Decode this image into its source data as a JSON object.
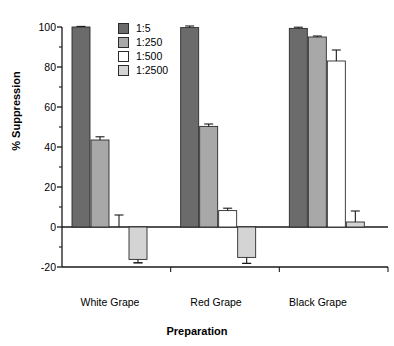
{
  "chart_data": {
    "type": "bar",
    "title": "",
    "subtitle": "",
    "xlabel": "Preparation",
    "ylabel": "% Suppression",
    "categories": [
      "White Grape",
      "Red Grape",
      "Black Grape"
    ],
    "ylim": [
      -20,
      100
    ],
    "yticks": [
      -20,
      0,
      20,
      40,
      60,
      80,
      100
    ],
    "ytick_labels": [
      "-20",
      "0",
      "20",
      "40",
      "60",
      "80",
      "100"
    ],
    "minor_ticks": true,
    "grid": false,
    "legend_position": "upper-left-inside",
    "zero_line": true,
    "series": [
      {
        "name": "1:5",
        "color": "#6b6b6b",
        "values": [
          100,
          99.7,
          99.3
        ],
        "errors": [
          0.3,
          0.8,
          0.6
        ]
      },
      {
        "name": "1:250",
        "color": "#a8a8a8",
        "values": [
          43.5,
          50.3,
          95.0
        ],
        "errors": [
          1.6,
          1.2,
          0.5
        ]
      },
      {
        "name": "1:500",
        "color": "#ffffff",
        "values": [
          0.0,
          8.2,
          83.0
        ],
        "errors": [
          6.0,
          1.2,
          5.5
        ]
      },
      {
        "name": "1:2500",
        "color": "#d4d4d4",
        "values": [
          -16.2,
          -15.2,
          2.5
        ],
        "errors": [
          1.7,
          3.0,
          5.5
        ]
      }
    ]
  },
  "legend": {
    "entries": [
      {
        "label": "1:5",
        "color": "#6b6b6b"
      },
      {
        "label": "1:250",
        "color": "#a8a8a8"
      },
      {
        "label": "1:500",
        "color": "#ffffff"
      },
      {
        "label": "1:2500",
        "color": "#d4d4d4"
      }
    ]
  },
  "axes": {
    "y_title": "% Suppression",
    "x_title": "Preparation",
    "y_labels": [
      "100",
      "80",
      "60",
      "40",
      "20",
      "0",
      "-20"
    ],
    "x_labels": [
      "White Grape",
      "Red Grape",
      "Black Grape"
    ]
  },
  "colors": {
    "axis": "#1a1a1a",
    "background": "#ffffff",
    "series_1_5": "#6b6b6b",
    "series_1_250": "#a8a8a8",
    "series_1_500": "#ffffff",
    "series_1_2500": "#d4d4d4"
  }
}
